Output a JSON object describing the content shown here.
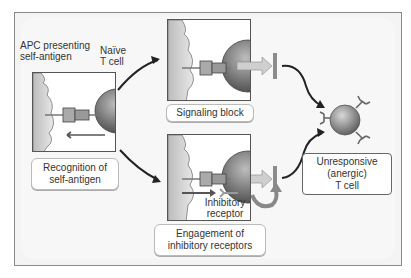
{
  "labels": {
    "apc": [
      "APC presenting",
      "self-antigen"
    ],
    "naive": [
      "Naïve",
      "T cell"
    ],
    "recognition": [
      "Recognition of",
      "self-antigen"
    ],
    "signaling_block": "Signaling block",
    "inhibitory_receptor": [
      "Inhibitory",
      "receptor"
    ],
    "engagement": [
      "Engagement of",
      "inhibitory receptors"
    ],
    "result": [
      "Unresponsive",
      "(anergic)",
      "T cell"
    ]
  },
  "colors": {
    "frame_border": "#8a8a8a",
    "background": "#f4f4f4",
    "apc_fill": "#c8c8c8",
    "tcell_fill": "#6e6e6e",
    "arrow": "#222222",
    "signal_arrow": "#c9c9c9",
    "block_bar": "#8c8c8c"
  }
}
